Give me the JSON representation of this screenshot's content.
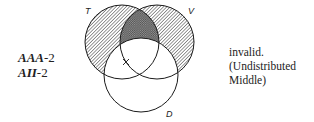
{
  "diagram": {
    "type": "venn-syllogism",
    "circles": [
      {
        "id": "T",
        "label": "T",
        "cx": 122,
        "cy": 42,
        "r": 37
      },
      {
        "id": "V",
        "label": "V",
        "cx": 157,
        "cy": 42,
        "r": 37
      },
      {
        "id": "D",
        "label": "D",
        "cx": 141,
        "cy": 75,
        "r": 37
      }
    ],
    "shading": {
      "T_only": "hatched",
      "V_only": "hatched",
      "T_and_V_not_D": "cross-hatched",
      "mark": {
        "symbol": "X",
        "region": "on T boundary inside D"
      }
    }
  },
  "forms": {
    "line1": {
      "mood": "AAA",
      "figure": "-2"
    },
    "line2": {
      "mood": "AII",
      "figure": "-2"
    }
  },
  "verdict": {
    "line1": "invalid.",
    "line2": "(Undistributed",
    "line3": "Middle)"
  },
  "colors": {
    "stroke": "#1a1a1a",
    "hatch": "#555555",
    "background": "#ffffff"
  }
}
